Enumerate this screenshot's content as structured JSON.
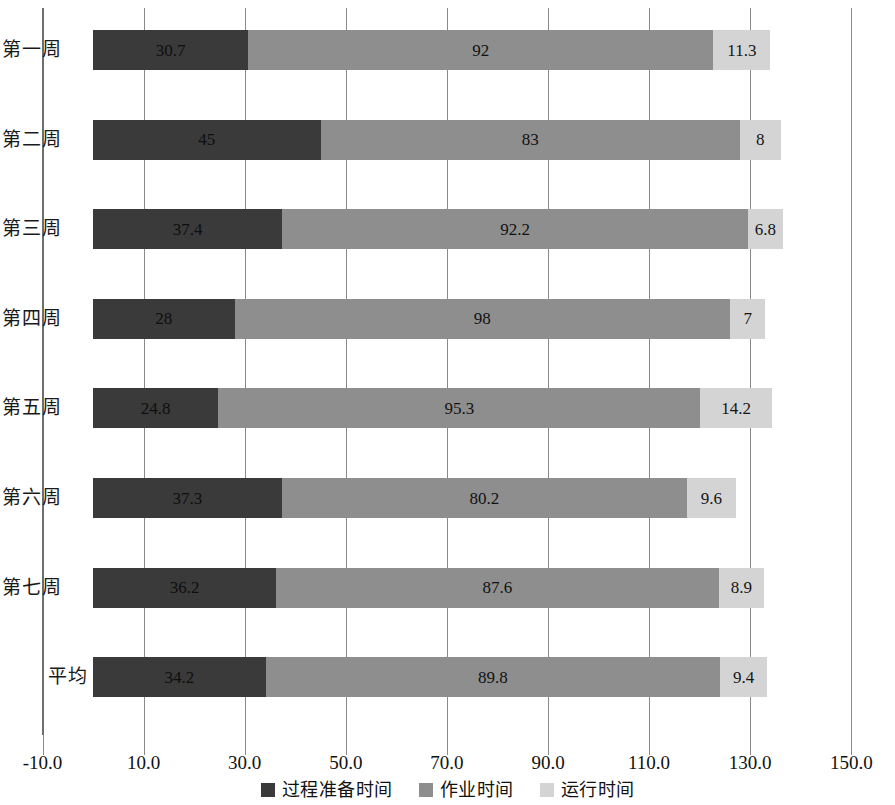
{
  "chart_data": {
    "type": "bar",
    "orientation": "horizontal",
    "stacked": true,
    "title": "",
    "subtitle": "",
    "xlabel": "",
    "ylabel": "",
    "grid": true,
    "legend_position": "bottom",
    "xlim": [
      -10.0,
      150.0
    ],
    "xticks": [
      -10.0,
      10.0,
      30.0,
      50.0,
      70.0,
      90.0,
      110.0,
      130.0,
      150.0
    ],
    "xtick_labels": [
      "-10.0",
      "10.0",
      "30.0",
      "50.0",
      "70.0",
      "90.0",
      "110.0",
      "130.0",
      "150.0"
    ],
    "categories": [
      "第一周",
      "第二周",
      "第三周",
      "第四周",
      "第五周",
      "第六周",
      "第七周",
      "平均"
    ],
    "series": [
      {
        "name": "过程准备时间",
        "color": "#3a3a3a",
        "values": [
          30.7,
          45,
          37.4,
          28,
          24.8,
          37.3,
          36.2,
          34.2
        ],
        "labels": [
          "30.7",
          "45",
          "37.4",
          "28",
          "24.8",
          "37.3",
          "36.2",
          "34.2"
        ]
      },
      {
        "name": "作业时间",
        "color": "#8e8e8e",
        "values": [
          92,
          83,
          92.2,
          98,
          95.3,
          80.2,
          87.6,
          89.8
        ],
        "labels": [
          "92",
          "83",
          "92.2",
          "98",
          "95.3",
          "80.2",
          "87.6",
          "89.8"
        ]
      },
      {
        "name": "运行时间",
        "color": "#d4d4d4",
        "values": [
          11.3,
          8,
          6.8,
          7,
          14.2,
          9.6,
          8.9,
          9.4
        ],
        "labels": [
          "11.3",
          "8",
          "6.8",
          "7",
          "14.2",
          "9.6",
          "8.9",
          "9.4"
        ]
      }
    ]
  },
  "legend": {
    "items": [
      {
        "label": "过程准备时间",
        "color": "#3a3a3a"
      },
      {
        "label": "作业时间",
        "color": "#8e8e8e"
      },
      {
        "label": "运行时间",
        "color": "#d4d4d4"
      }
    ]
  },
  "axis": {
    "x_tick_labels": [
      "-10.0",
      "10.0",
      "30.0",
      "50.0",
      "70.0",
      "90.0",
      "110.0",
      "130.0",
      "150.0"
    ],
    "y_tick_labels": [
      "第一周",
      "第二周",
      "第三周",
      "第四周",
      "第五周",
      "第六周",
      "第七周",
      "平均"
    ]
  }
}
